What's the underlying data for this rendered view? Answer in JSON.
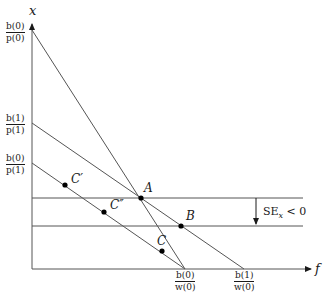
{
  "diagram": {
    "axes": {
      "x_axis_label": "f",
      "y_axis_label": "x",
      "origin": [
        32,
        269
      ]
    },
    "y_intercept_labels": [
      {
        "id": "b0_p0",
        "num": "b(0)",
        "den": "p(0)"
      },
      {
        "id": "b1_p1",
        "num": "b(1)",
        "den": "p(1)"
      },
      {
        "id": "b0_p1",
        "num": "b(0)",
        "den": "p(1)"
      }
    ],
    "x_intercept_labels": [
      {
        "id": "b0_w0",
        "num": "b(0)",
        "den": "w(0)"
      },
      {
        "id": "b1_w0",
        "num": "b(1)",
        "den": "w(0)"
      }
    ],
    "budget_lines": [
      {
        "id": "line-b0p0-b0w0",
        "from": [
          32,
          30
        ],
        "to": [
          185,
          269
        ]
      },
      {
        "id": "line-b1p1-b1w0",
        "from": [
          32,
          123
        ],
        "to": [
          244,
          269
        ]
      },
      {
        "id": "line-b0p1-b0w0",
        "from": [
          32,
          163
        ],
        "to": [
          185,
          269
        ]
      }
    ],
    "horizontal_lines": [
      {
        "id": "level-A",
        "y": 198,
        "x_from": 32,
        "x_to": 303
      },
      {
        "id": "level-B",
        "y": 226,
        "x_from": 32,
        "x_to": 303
      }
    ],
    "points": [
      {
        "label": "A",
        "x": 141,
        "y": 198
      },
      {
        "label": "B",
        "x": 181,
        "y": 226
      },
      {
        "label": "C",
        "x": 162,
        "y": 251
      },
      {
        "label": "C′",
        "x": 65,
        "y": 185
      },
      {
        "label": "C″",
        "x": 104,
        "y": 212
      }
    ],
    "annotation": {
      "text_main": "SE",
      "text_sub": "x",
      "text_rel": "< 0",
      "arrow_x": 256,
      "arrow_from_y": 198,
      "arrow_to_y": 226
    }
  }
}
